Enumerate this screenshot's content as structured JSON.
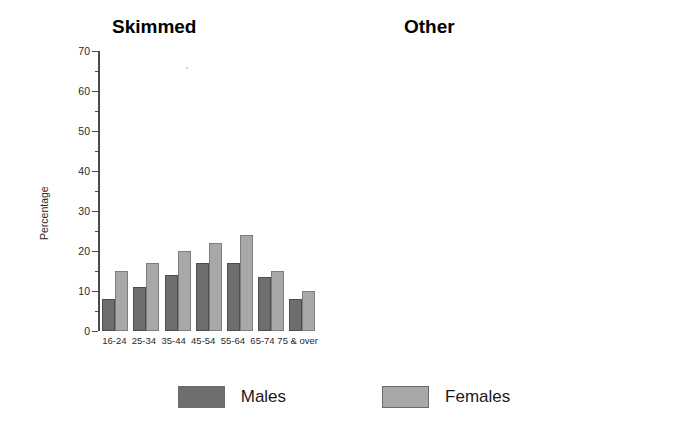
{
  "legend": {
    "items": [
      {
        "label": "Males",
        "color": "#6e6e6e",
        "key": "male"
      },
      {
        "label": "Females",
        "color": "#a8a8a8",
        "key": "female"
      }
    ]
  },
  "axis": {
    "ylabel": "Percentage",
    "ticks_major": [
      "0",
      "10",
      "20",
      "30",
      "40",
      "50",
      "60",
      "70"
    ]
  },
  "panels": [
    {
      "id": "skimmed",
      "title": "Skimmed",
      "ylabel": "Percentage"
    },
    {
      "id": "other",
      "title": "Other",
      "ylabel": "Percentage"
    }
  ],
  "chart_data": [
    {
      "type": "bar",
      "title": "Skimmed",
      "xlabel": "",
      "ylabel": "Percentage",
      "ylim": [
        0,
        70
      ],
      "ytick_step": 10,
      "yminor_step": 5,
      "grid": false,
      "legend_position": "bottom",
      "categories": [
        "16-24",
        "25-34",
        "35-44",
        "45-54",
        "55-64",
        "65-74",
        "75 & over"
      ],
      "series": [
        {
          "name": "Males",
          "color": "#6e6e6e",
          "values": [
            8,
            11,
            14,
            17,
            17,
            13.5,
            8
          ]
        },
        {
          "name": "Females",
          "color": "#a8a8a8",
          "values": [
            15,
            17,
            20,
            22,
            24,
            15,
            10
          ]
        }
      ]
    },
    {
      "type": "bar",
      "title": "Other",
      "xlabel": "",
      "ylabel": "Percentage",
      "ylim": [
        0,
        70
      ],
      "ytick_step": 10,
      "yminor_step": 5,
      "grid": false,
      "legend_position": "bottom",
      "categories": [
        "16-24",
        "25-34",
        "35-44",
        "45-54",
        "55-64",
        "65-74",
        "75 & over"
      ],
      "series": [
        {
          "name": "Males",
          "color": "#6e6e6e",
          "values": [
            1,
            1,
            1.5,
            1,
            1,
            2,
            2
          ]
        },
        {
          "name": "Females",
          "color": "#a8a8a8",
          "values": [
            1,
            1,
            1.5,
            1,
            1,
            1,
            1
          ]
        }
      ]
    }
  ]
}
